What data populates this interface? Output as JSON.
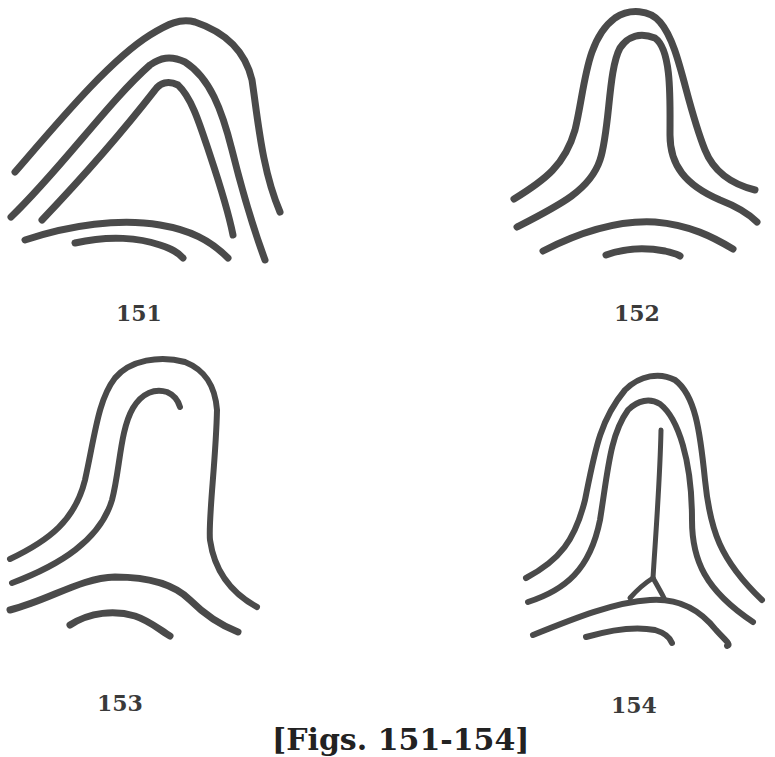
{
  "document": {
    "type": "scanned book illustration",
    "subject": "fingerprint ridge patterns"
  },
  "figures": [
    {
      "id": "151",
      "label": "151",
      "description": "Tented arch with sharply angled apex, three nested ridges over two curved lower ridges"
    },
    {
      "id": "152",
      "label": "152",
      "description": "Tented arch with rounded upthrust, two nested ridges over two arched lower ridges"
    },
    {
      "id": "153",
      "label": "153",
      "description": "Arch with inner ridge ending in a recurving hook, over two lower ridges"
    },
    {
      "id": "154",
      "label": "154",
      "description": "Tented arch with central vertical ridge meeting lower ridge in a small triangular delta"
    }
  ],
  "caption": "[Figs. 151-154]",
  "colors": {
    "ink": "#4a4a4a",
    "background": "#ffffff"
  }
}
